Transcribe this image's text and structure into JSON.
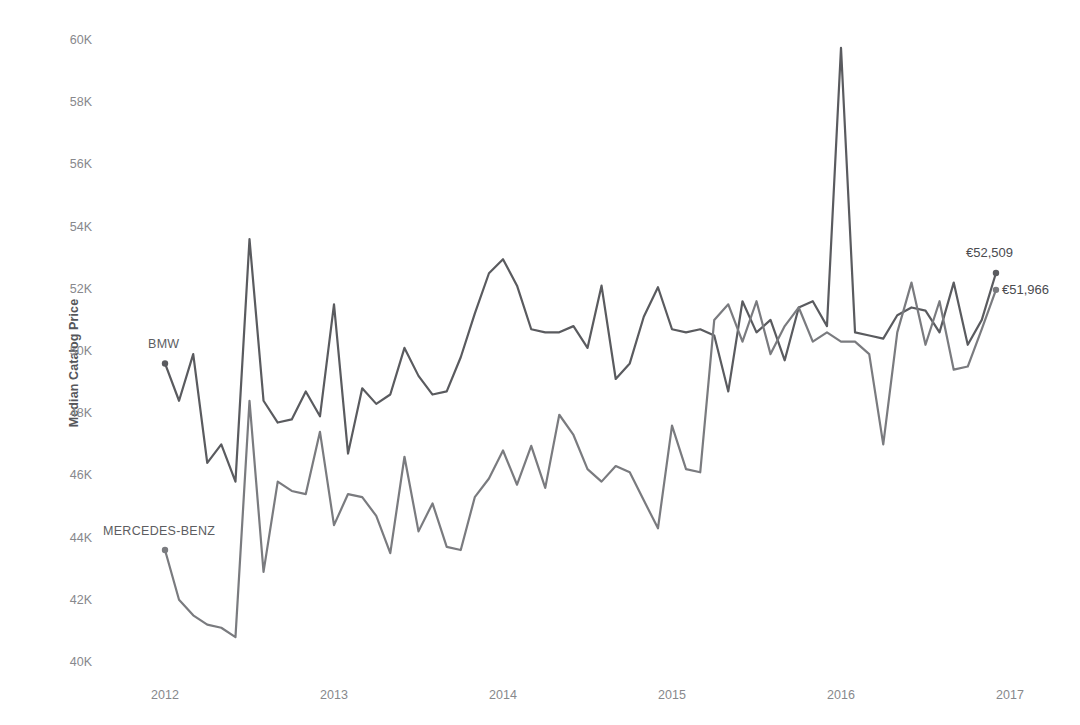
{
  "chart_data": {
    "type": "line",
    "title": "",
    "xlabel": "",
    "ylabel": "Median Catalog Price",
    "currency_symbol": "€",
    "xlim": [
      2012.0,
      2016.92
    ],
    "ylim": [
      40000,
      60000
    ],
    "y_ticks": [
      40000,
      42000,
      44000,
      46000,
      48000,
      50000,
      52000,
      54000,
      56000,
      58000,
      60000
    ],
    "y_tick_labels": [
      "40K",
      "42K",
      "44K",
      "46K",
      "48K",
      "50K",
      "52K",
      "54K",
      "56K",
      "58K",
      "60K"
    ],
    "x_ticks": [
      2012,
      2013,
      2014,
      2015,
      2016,
      2017
    ],
    "x_tick_labels": [
      "2012",
      "2013",
      "2014",
      "2015",
      "2016",
      "2017"
    ],
    "grid": false,
    "legend_position": "inline-labels",
    "line_color_bmw": "#5a5b5f",
    "line_color_mercedes": "#7a7b7f",
    "series": [
      {
        "name": "BMW",
        "label": "BMW",
        "label_x": 2012.0,
        "label_y": 49600,
        "end_label": "€52,509",
        "end_value": 52509,
        "x": [
          2012.0,
          2012.083,
          2012.167,
          2012.25,
          2012.333,
          2012.417,
          2012.5,
          2012.583,
          2012.667,
          2012.75,
          2012.833,
          2012.917,
          2013.0,
          2013.083,
          2013.167,
          2013.25,
          2013.333,
          2013.417,
          2013.5,
          2013.583,
          2013.667,
          2013.75,
          2013.833,
          2013.917,
          2014.0,
          2014.083,
          2014.167,
          2014.25,
          2014.333,
          2014.417,
          2014.5,
          2014.583,
          2014.667,
          2014.75,
          2014.833,
          2014.917,
          2015.0,
          2015.083,
          2015.167,
          2015.25,
          2015.333,
          2015.417,
          2015.5,
          2015.583,
          2015.667,
          2015.75,
          2015.833,
          2015.917,
          2016.0,
          2016.083,
          2016.167,
          2016.25,
          2016.333,
          2016.417,
          2016.5,
          2016.583,
          2016.667,
          2016.75,
          2016.833,
          2016.917
        ],
        "values": [
          49600,
          48400,
          49900,
          46400,
          47000,
          45800,
          53600,
          48400,
          47700,
          47800,
          48700,
          47900,
          51500,
          46700,
          48800,
          48300,
          48600,
          50100,
          49200,
          48600,
          48700,
          49800,
          51200,
          52500,
          52950,
          52100,
          50700,
          50600,
          50600,
          50800,
          50100,
          52100,
          49100,
          49600,
          51100,
          52050,
          50700,
          50600,
          50700,
          50500,
          48700,
          51600,
          50600,
          51000,
          49700,
          51400,
          51600,
          50800,
          59750,
          50600,
          50500,
          50400,
          51150,
          51400,
          51300,
          50600,
          52200,
          50200,
          51000,
          52509
        ]
      },
      {
        "name": "MERCEDES-BENZ",
        "label": "MERCEDES-BENZ",
        "label_x": 2012.0,
        "label_y": 43600,
        "end_label": "€51,966",
        "end_value": 51966,
        "x": [
          2012.0,
          2012.083,
          2012.167,
          2012.25,
          2012.333,
          2012.417,
          2012.5,
          2012.583,
          2012.667,
          2012.75,
          2012.833,
          2012.917,
          2013.0,
          2013.083,
          2013.167,
          2013.25,
          2013.333,
          2013.417,
          2013.5,
          2013.583,
          2013.667,
          2013.75,
          2013.833,
          2013.917,
          2014.0,
          2014.083,
          2014.167,
          2014.25,
          2014.333,
          2014.417,
          2014.5,
          2014.583,
          2014.667,
          2014.75,
          2014.833,
          2014.917,
          2015.0,
          2015.083,
          2015.167,
          2015.25,
          2015.333,
          2015.417,
          2015.5,
          2015.583,
          2015.667,
          2015.75,
          2015.833,
          2015.917,
          2016.0,
          2016.083,
          2016.167,
          2016.25,
          2016.333,
          2016.417,
          2016.5,
          2016.583,
          2016.667,
          2016.75,
          2016.833,
          2016.917
        ],
        "values": [
          43600,
          42000,
          41500,
          41200,
          41100,
          40800,
          48400,
          42900,
          45800,
          45500,
          45400,
          47400,
          44400,
          45400,
          45300,
          44700,
          43500,
          46600,
          44200,
          45100,
          43700,
          43600,
          45300,
          45900,
          46800,
          45700,
          46950,
          45600,
          47950,
          47300,
          46200,
          45800,
          46300,
          46100,
          45200,
          44300,
          47600,
          46200,
          46100,
          51000,
          51500,
          50300,
          51600,
          49900,
          50800,
          51400,
          50300,
          50600,
          50300,
          50300,
          49900,
          47000,
          50600,
          52200,
          50200,
          51600,
          49400,
          49500,
          50700,
          51966
        ]
      }
    ]
  },
  "labels": {
    "y_axis_title": "Median Catalog Price",
    "bmw": "BMW",
    "mercedes": "MERCEDES-BENZ",
    "bmw_end": "€52,509",
    "mercedes_end": "€51,966"
  }
}
